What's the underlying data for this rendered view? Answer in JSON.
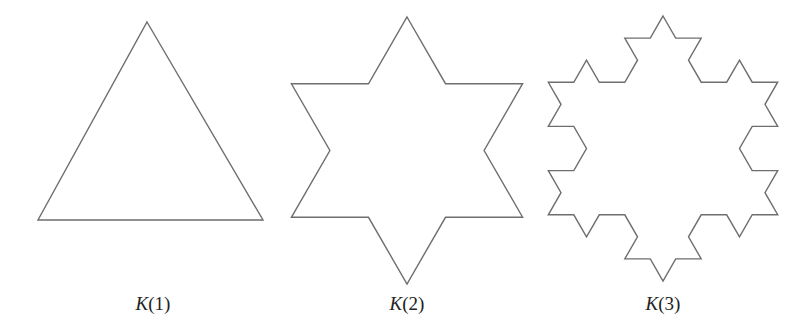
{
  "figures": [
    {
      "id": "k1",
      "name": "K",
      "arg": "1",
      "label": "K(1)",
      "iterations": 0,
      "center_x": 153
    },
    {
      "id": "k2",
      "name": "K",
      "arg": "2",
      "label": "K(2)",
      "iterations": 1,
      "center_x": 407
    },
    {
      "id": "k3",
      "name": "K",
      "arg": "3",
      "label": "K(3)",
      "iterations": 2,
      "center_x": 663
    }
  ],
  "colors": {
    "stroke": "#6e6e6e",
    "background": "#ffffff",
    "text": "#222222"
  }
}
